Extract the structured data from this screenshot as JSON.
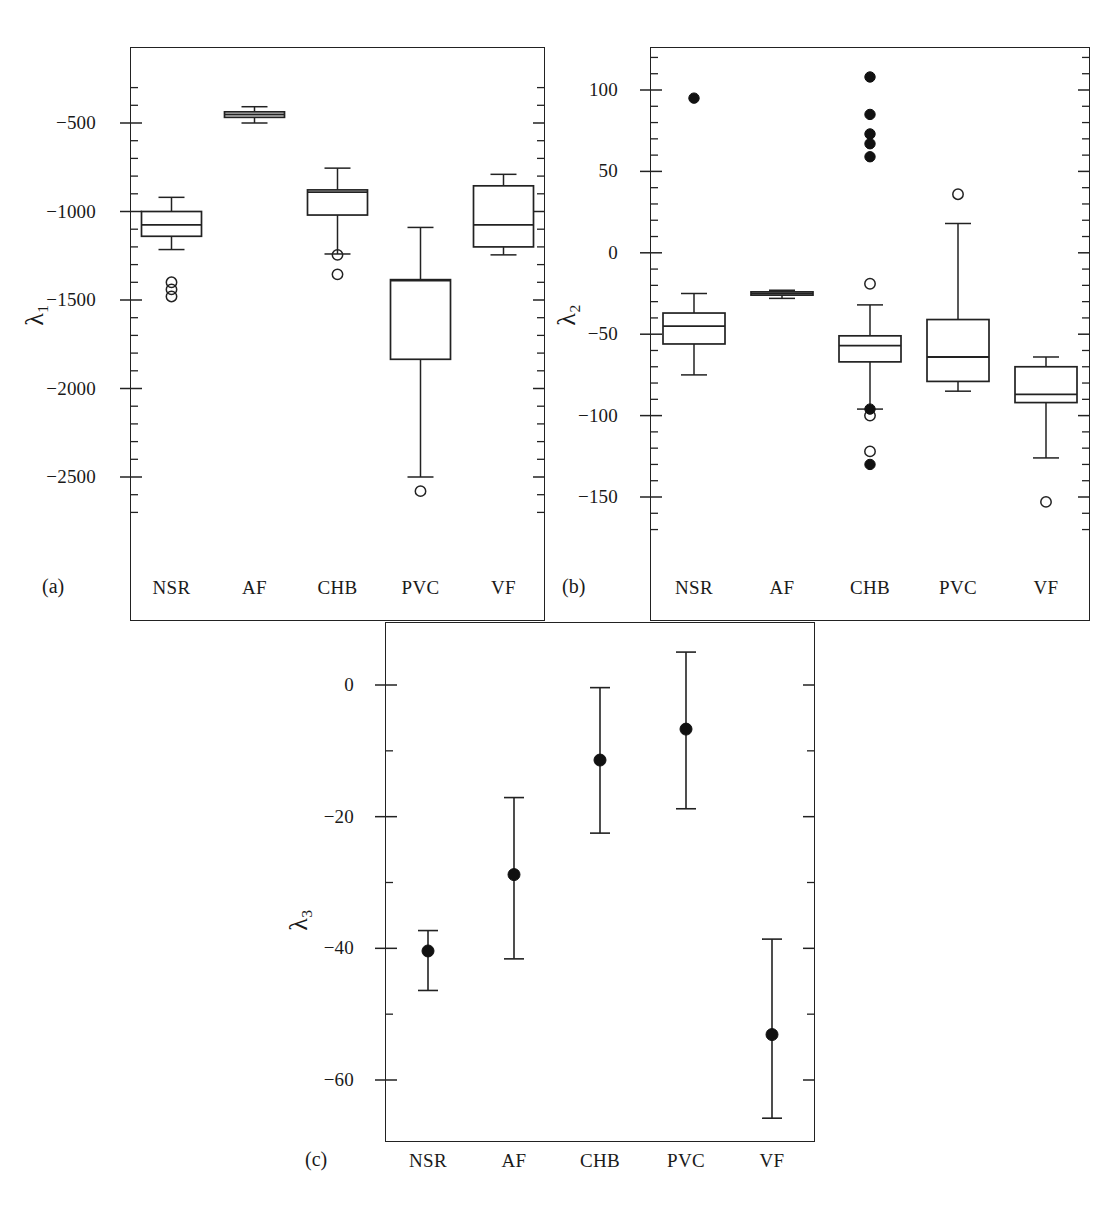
{
  "figure": {
    "panel_tags": [
      "(a)",
      "(b)",
      "(c)"
    ],
    "categories": [
      "NSR",
      "AF",
      "CHB",
      "PVC",
      "VF"
    ]
  },
  "chart_data": [
    {
      "type": "box",
      "panel": "(a)",
      "title": "",
      "xlabel": "",
      "ylabel": "λ₁",
      "ylabel_sub": "1",
      "ylim": [
        -2700,
        -300
      ],
      "yticks": [
        -500,
        -1000,
        -1500,
        -2000,
        -2500
      ],
      "ytick_labels": [
        "−500",
        "−1000",
        "−1500",
        "−2000",
        "−2500"
      ],
      "minor_tick_step": 100,
      "grid": false,
      "legend": "none",
      "categories": [
        "NSR",
        "AF",
        "CHB",
        "PVC",
        "VF"
      ],
      "boxes": [
        {
          "name": "NSR",
          "whisker_low": -1215,
          "q1": -1140,
          "median": -1075,
          "q3": -1000,
          "whisker_high": -920,
          "outliers_open": [
            -1400,
            -1440,
            -1480
          ],
          "outliers_filled": []
        },
        {
          "name": "AF",
          "whisker_low": -500,
          "q1": -468,
          "median": -452,
          "q3": -437,
          "whisker_high": -408,
          "outliers_open": [],
          "outliers_filled": []
        },
        {
          "name": "CHB",
          "whisker_low": -1240,
          "q1": -1020,
          "median": -890,
          "q3": -878,
          "whisker_high": -755,
          "outliers_open": [
            -1245,
            -1355
          ],
          "outliers_filled": []
        },
        {
          "name": "PVC",
          "whisker_low": -2500,
          "q1": -1835,
          "median": -1390,
          "q3": -1385,
          "whisker_high": -1090,
          "outliers_open": [
            -2580
          ],
          "outliers_filled": []
        },
        {
          "name": "VF",
          "whisker_low": -1245,
          "q1": -1200,
          "median": -1075,
          "q3": -855,
          "whisker_high": -790,
          "outliers_open": [],
          "outliers_filled": []
        }
      ]
    },
    {
      "type": "box",
      "panel": "(b)",
      "title": "",
      "xlabel": "",
      "ylabel": "λ₂",
      "ylabel_sub": "2",
      "ylim": [
        -170,
        120
      ],
      "yticks": [
        100,
        50,
        0,
        -50,
        -100,
        -150
      ],
      "ytick_labels": [
        "100",
        "50",
        "0",
        "−50",
        "−100",
        "−150"
      ],
      "minor_tick_step": 10,
      "grid": false,
      "legend": "none",
      "categories": [
        "NSR",
        "AF",
        "CHB",
        "PVC",
        "VF"
      ],
      "boxes": [
        {
          "name": "NSR",
          "whisker_low": -75,
          "q1": -56,
          "median": -45,
          "q3": -37,
          "whisker_high": -25,
          "outliers_open": [],
          "outliers_filled": [
            95
          ]
        },
        {
          "name": "AF",
          "whisker_low": -28,
          "q1": -26,
          "median": -25,
          "q3": -24,
          "whisker_high": -23,
          "outliers_open": [],
          "outliers_filled": []
        },
        {
          "name": "CHB",
          "whisker_low": -96,
          "q1": -67,
          "median": -57,
          "q3": -51,
          "whisker_high": -32,
          "outliers_open": [
            -19,
            -100,
            -122
          ],
          "outliers_filled": [
            108,
            85,
            73,
            67,
            59,
            -96,
            -130
          ]
        },
        {
          "name": "PVC",
          "whisker_low": -85,
          "q1": -79,
          "median": -64,
          "q3": -41,
          "whisker_high": 18,
          "outliers_open": [
            36
          ],
          "outliers_filled": []
        },
        {
          "name": "VF",
          "whisker_low": -126,
          "q1": -92,
          "median": -87,
          "q3": -70,
          "whisker_high": -64,
          "outliers_open": [
            -153
          ],
          "outliers_filled": []
        }
      ]
    },
    {
      "type": "errorbar",
      "panel": "(c)",
      "title": "",
      "xlabel": "",
      "ylabel": "λ₃",
      "ylabel_sub": "3",
      "ylim": [
        -70,
        8
      ],
      "yticks": [
        0,
        -20,
        -40,
        -60
      ],
      "ytick_labels": [
        "0",
        "−20",
        "−40",
        "−60"
      ],
      "minor_tick_step": 10,
      "grid": false,
      "legend": "none",
      "categories": [
        "NSR",
        "AF",
        "CHB",
        "PVC",
        "VF"
      ],
      "points": [
        {
          "name": "NSR",
          "value": -40.4,
          "high": -37.3,
          "low": -46.4
        },
        {
          "name": "AF",
          "value": -28.8,
          "high": -17.1,
          "low": -41.6
        },
        {
          "name": "CHB",
          "value": -11.4,
          "high": -0.4,
          "low": -22.5
        },
        {
          "name": "PVC",
          "value": -6.7,
          "high": 5.0,
          "low": -18.8
        },
        {
          "name": "VF",
          "value": -53.1,
          "high": -38.6,
          "low": -65.8
        }
      ]
    }
  ]
}
